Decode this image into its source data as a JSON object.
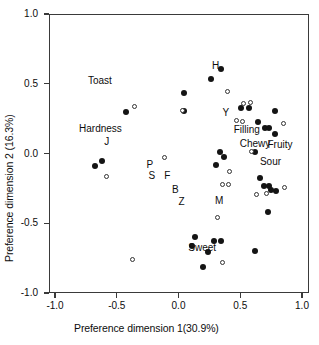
{
  "chart_data": {
    "type": "scatter",
    "title": "",
    "xlabel": "Preference dimension 1(30.9%)",
    "ylabel": "Preference dimension 2 (16.3%)",
    "xlim": [
      -1.0,
      1.0
    ],
    "ylim": [
      -1.0,
      1.0
    ],
    "xticks": [
      "-1.0",
      "-0.5",
      "0.0",
      "0.5",
      "1.0"
    ],
    "yticks": [
      "1.0",
      "0.5",
      "0.0",
      "-0.5",
      "-1.0"
    ],
    "xtick_values": [
      -1.0,
      -0.5,
      0.0,
      0.5,
      1.0
    ],
    "ytick_values": [
      1.0,
      0.5,
      0.0,
      -0.5,
      -1.0
    ],
    "grid": false,
    "legend": "none",
    "series": [
      {
        "name": "filled-circles",
        "marker": "filled circle",
        "color": "#141414",
        "points": [
          [
            -0.425,
            0.298
          ],
          [
            -0.68,
            -0.093
          ],
          [
            -0.623,
            -0.057
          ],
          [
            0.045,
            0.436
          ],
          [
            0.041,
            0.308
          ],
          [
            0.267,
            0.536
          ],
          [
            0.348,
            0.607
          ],
          [
            0.51,
            0.329
          ],
          [
            0.567,
            0.327
          ],
          [
            0.34,
            0.011
          ],
          [
            0.365,
            -0.022
          ],
          [
            0.3,
            -0.079
          ],
          [
            0.64,
            0.227
          ],
          [
            0.697,
            0.186
          ],
          [
            0.733,
            0.186
          ],
          [
            0.778,
            0.307
          ],
          [
            0.783,
            0.141
          ],
          [
            0.62,
            0.013
          ],
          [
            0.66,
            -0.179
          ],
          [
            0.696,
            -0.23
          ],
          [
            0.735,
            -0.236
          ],
          [
            0.745,
            -0.264
          ],
          [
            0.79,
            -0.271
          ],
          [
            0.722,
            -0.417
          ],
          [
            0.13,
            -0.601
          ],
          [
            0.113,
            -0.666
          ],
          [
            0.238,
            -0.708
          ],
          [
            0.288,
            -0.624
          ],
          [
            0.345,
            -0.624
          ],
          [
            0.2,
            -0.815
          ],
          [
            0.62,
            -0.702
          ]
        ]
      },
      {
        "name": "open-circles",
        "marker": "open circle",
        "color": "#333333",
        "points": [
          [
            -0.36,
            0.334
          ],
          [
            -0.583,
            -0.165
          ],
          [
            -0.113,
            -0.03
          ],
          [
            0.035,
            0.307
          ],
          [
            0.4,
            0.444
          ],
          [
            0.53,
            0.362
          ],
          [
            0.587,
            0.364
          ],
          [
            0.47,
            0.234
          ],
          [
            0.515,
            0.232
          ],
          [
            0.592,
            0.013
          ],
          [
            0.853,
            0.213
          ],
          [
            0.86,
            -0.247
          ],
          [
            0.635,
            -0.293
          ],
          [
            0.712,
            -0.286
          ],
          [
            0.41,
            -0.128
          ],
          [
            0.355,
            -0.222
          ],
          [
            0.403,
            -0.222
          ],
          [
            0.312,
            -0.457
          ],
          [
            -0.373,
            -0.763
          ],
          [
            0.36,
            -0.778
          ]
        ]
      }
    ],
    "annotations": [
      {
        "text": "Toast",
        "x": -0.636,
        "y": 0.53
      },
      {
        "text": "Hardness",
        "x": -0.632,
        "y": 0.181
      },
      {
        "text": "J",
        "x": -0.58,
        "y": 0.092
      },
      {
        "text": "H",
        "x": 0.3,
        "y": 0.635
      },
      {
        "text": "Y",
        "x": 0.384,
        "y": 0.3
      },
      {
        "text": "Filling",
        "x": 0.553,
        "y": 0.175
      },
      {
        "text": "Chewy",
        "x": 0.62,
        "y": 0.075
      },
      {
        "text": "Fruity",
        "x": 0.822,
        "y": 0.07
      },
      {
        "text": "Sour",
        "x": 0.745,
        "y": -0.053
      },
      {
        "text": "P",
        "x": -0.232,
        "y": -0.075
      },
      {
        "text": "S",
        "x": -0.215,
        "y": -0.155
      },
      {
        "text": "F",
        "x": -0.09,
        "y": -0.155
      },
      {
        "text": "B",
        "x": -0.026,
        "y": -0.252
      },
      {
        "text": "Z",
        "x": 0.025,
        "y": -0.34
      },
      {
        "text": "M",
        "x": 0.33,
        "y": -0.33
      },
      {
        "text": "Sweet",
        "x": 0.192,
        "y": -0.67
      }
    ]
  },
  "axes": {
    "x_title": "Preference dimension 1(30.9%)",
    "y_title": "Preference dimension 2 (16.3%)"
  }
}
